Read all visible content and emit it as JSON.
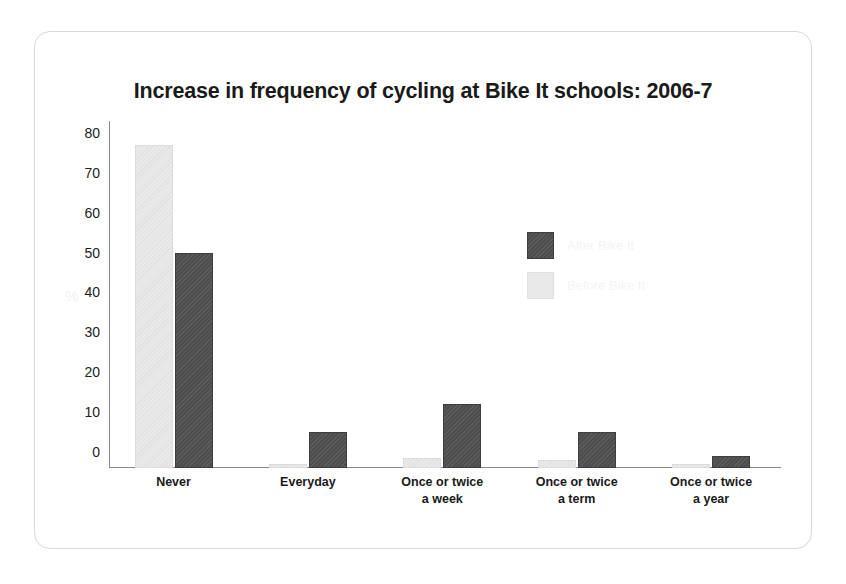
{
  "chart_data": {
    "type": "bar",
    "title": "Increase in frequency of cycling at Bike It schools: 2006-7",
    "xlabel": "",
    "ylabel": "%",
    "ylim": [
      0,
      87
    ],
    "yticks": [
      0,
      10,
      20,
      30,
      40,
      50,
      60,
      70,
      80
    ],
    "ytick_labels": [
      "0",
      "10",
      "20",
      "30",
      "40",
      "50",
      "60",
      "70",
      "80"
    ],
    "grid": false,
    "legend_position": "inside-upper-right",
    "categories": [
      "Never",
      "Everyday",
      "Once or twice a week",
      "Once or twice a term",
      "Once or twice a year"
    ],
    "category_lines": [
      [
        "Never",
        ""
      ],
      [
        "Everyday",
        ""
      ],
      [
        "Once or twice",
        "a week"
      ],
      [
        "Once or twice",
        "a term"
      ],
      [
        "Once or twice",
        "a year"
      ]
    ],
    "series": [
      {
        "name": "Before Bike It",
        "color": "#e9e9e9",
        "values": [
          81,
          1,
          2.5,
          2,
          1
        ]
      },
      {
        "name": "After Bike It",
        "color": "#4d4d4d",
        "values": [
          54,
          9,
          16,
          9,
          3
        ]
      }
    ]
  },
  "legend": {
    "entries": [
      {
        "label": "After Bike It",
        "swatch": "after"
      },
      {
        "label": "Before Bike It",
        "swatch": "before"
      }
    ]
  },
  "axis": {
    "y_title": "%"
  }
}
